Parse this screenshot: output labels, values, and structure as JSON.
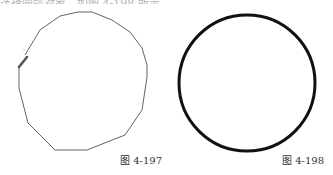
{
  "page": {
    "top_text_fragment": "选择圆弧对象，如图 4-198 所示。"
  },
  "figures": [
    {
      "id": "left",
      "caption": "图 4-197",
      "description": "hand-drawn polyline loop before conversion",
      "stroke_color": "#3a3a3a",
      "stroke_width": 0.8,
      "points": "25,55 40,30 60,16 78,12 92,12 112,20 130,32 142,48 147,65 147,77 142,110 125,135 87,150 55,150 28,123 19,88 19,68",
      "marker_color": "#555555"
    },
    {
      "id": "right",
      "caption": "图 4-198",
      "description": "resulting circle",
      "stroke_color": "#111111",
      "stroke_width": 3,
      "cx": 247,
      "cy": 83,
      "r": 68
    }
  ]
}
